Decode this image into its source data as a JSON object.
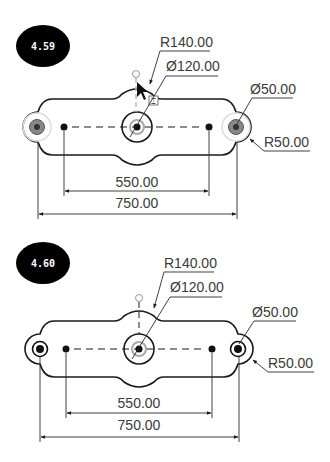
{
  "figures": [
    {
      "id": "fig-4-59",
      "badge": "4.59",
      "state": "editing",
      "dimensions": {
        "radius_center": "R140.00",
        "diameter_center": "Ø120.00",
        "diameter_end": "Ø50.00",
        "radius_end": "R50.00",
        "inner_span": "550.00",
        "overall_span": "750.00"
      }
    },
    {
      "id": "fig-4-60",
      "badge": "4.60",
      "state": "completed",
      "dimensions": {
        "radius_center": "R140.00",
        "diameter_center": "Ø120.00",
        "diameter_end": "Ø50.00",
        "radius_end": "R50.00",
        "inner_span": "550.00",
        "overall_span": "750.00"
      }
    }
  ],
  "colors": {
    "badge_fill": "#000000",
    "line": "#1a1a1a",
    "text": "#3a3a3a",
    "highlight": "#9a9a9a"
  }
}
